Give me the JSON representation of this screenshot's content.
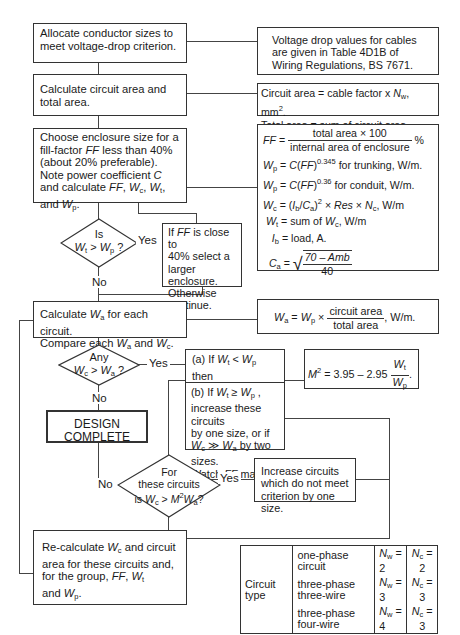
{
  "diagram": {
    "type": "flowchart",
    "steps": {
      "allocate": "Allocate conductor sizes to meet voltage-drop criterion.",
      "calc_area": "Calculate circuit area and total area.",
      "choose_enclosure": {
        "line1": "Choose enclosure size for a",
        "line2_pre": "fill-factor ",
        "line2_ff": "FF",
        "line2_post": " less than 40%",
        "line3": "(about 20% preferable).",
        "line4_pre": "Note power coefficient ",
        "line4_c": "C",
        "line5": "and calculate FF, Wc, Wt,",
        "line6": "and Wp."
      },
      "calc_wa": {
        "line1": "Calculate Wa for each circuit.",
        "line2": "Compare each Wa and Wc."
      },
      "design_complete": "DESIGN COMPLETE",
      "recalc": {
        "line1": "Re-calculate Wc and circuit",
        "line2": "area for these circuits and,",
        "line3": "for the group, FF, Wt",
        "line4": "and Wp."
      },
      "ff_close": {
        "line1": "If FF is close to",
        "line2": "40% select a",
        "line3": "larger enclosure.",
        "line4": "Otherwise",
        "line5": "continue."
      },
      "option_a": {
        "line1": "(a) If Wt < Wp then",
        "line2": "calculate M²."
      },
      "option_b": {
        "line1": "(b) If Wt ≥ Wp ,",
        "line2": "increase these circuits",
        "line3": "by one size, or if",
        "line4": "Wc ≫ Wa by two sizes.",
        "line5": "Watch FF max."
      },
      "increase": "Increase circuits which do not meet criterion by one size."
    },
    "decisions": {
      "d1": {
        "line1": "Is",
        "line2": "Wt > Wp ?",
        "yes": "Yes",
        "no": "No"
      },
      "d2": {
        "line1": "Any",
        "line2": "Wc > Wa ?",
        "yes": "Yes",
        "no": "No"
      },
      "d3": {
        "line1": "For",
        "line2": "these circuits",
        "line3": "is Wc > M²Wa?",
        "yes": "Yes",
        "no": "No"
      }
    },
    "notes": {
      "voltage_drop": "Voltage drop values for cables are given in Table 4D1B of Wiring Regulations, BS 7671.",
      "circuit_area": "Circuit area = cable factor x Nw, mm².",
      "total_area": "Total area = sum of circuit area, mm².",
      "ff_num": "total area × 100",
      "ff_den": "internal area of enclosure",
      "ff_unit": "%",
      "wp_trunking": "for trunking, W/m.",
      "wp_conduit": "for conduit, W/m.",
      "exp_trunking": "0.345",
      "exp_conduit": "0.36",
      "wc_tail": ", W/m",
      "wt_tail": "= sum of",
      "wt_unit": ", W/m",
      "ib": "= load, A.",
      "ca_num": "70 – Amb",
      "ca_den": "40",
      "wa_num": "circuit area",
      "wa_den": "total area",
      "wa_unit": ", W/m.",
      "m2_const": "= 3.95 – 2.95"
    },
    "circuit_table": {
      "row_header": "Circuit type",
      "rows": [
        {
          "type": "one-phase circuit",
          "nw": "= 2",
          "nc": "= 2"
        },
        {
          "type": "three-phase three-wire",
          "nw": "= 3",
          "nc": "= 3"
        },
        {
          "type": "three-phase four-wire",
          "nw": "= 4",
          "nc": "= 3"
        }
      ]
    }
  }
}
